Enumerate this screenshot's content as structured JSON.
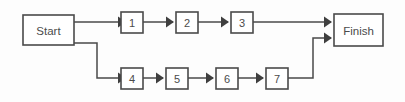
{
  "diagram": {
    "type": "flowchart",
    "background_color": "#fdfdfd",
    "line_color": "#4a4a4a",
    "text_color": "#4b4b4b",
    "nodes": [
      {
        "id": "start",
        "label": "Start",
        "shape": "rect",
        "x": 23,
        "y": 15,
        "w": 51,
        "h": 30
      },
      {
        "id": "n1",
        "label": "1",
        "shape": "rect",
        "x": 121,
        "y": 12,
        "w": 22,
        "h": 21
      },
      {
        "id": "n2",
        "label": "2",
        "shape": "rect",
        "x": 176,
        "y": 12,
        "w": 22,
        "h": 21
      },
      {
        "id": "n3",
        "label": "3",
        "shape": "rect",
        "x": 231,
        "y": 12,
        "w": 22,
        "h": 21
      },
      {
        "id": "finish",
        "label": "Finish",
        "shape": "rect",
        "x": 334,
        "y": 14,
        "w": 49,
        "h": 32
      },
      {
        "id": "n4",
        "label": "4",
        "shape": "rect",
        "x": 121,
        "y": 68,
        "w": 22,
        "h": 21
      },
      {
        "id": "n5",
        "label": "5",
        "shape": "rect",
        "x": 166,
        "y": 68,
        "w": 22,
        "h": 21
      },
      {
        "id": "n6",
        "label": "6",
        "shape": "rect",
        "x": 216,
        "y": 68,
        "w": 22,
        "h": 21
      },
      {
        "id": "n7",
        "label": "7",
        "shape": "rect",
        "x": 266,
        "y": 68,
        "w": 22,
        "h": 21
      }
    ],
    "edges": [
      {
        "id": "e-start-1",
        "from": "start",
        "to": "n1",
        "points": "74,22 118,22",
        "arrow": true
      },
      {
        "id": "e-1-2",
        "from": "n1",
        "to": "n2",
        "points": "143,22 173,22",
        "arrow": true
      },
      {
        "id": "e-2-3",
        "from": "n2",
        "to": "n3",
        "points": "198,22 228,22",
        "arrow": true
      },
      {
        "id": "e-3-finish",
        "from": "n3",
        "to": "finish",
        "points": "253,22 331,22",
        "arrow": true
      },
      {
        "id": "e-start-4",
        "from": "start",
        "to": "n4",
        "points": "74,43 97,43 97,78 118,78",
        "arrow": true
      },
      {
        "id": "e-4-5",
        "from": "n4",
        "to": "n5",
        "points": "143,78 163,78",
        "arrow": true
      },
      {
        "id": "e-5-6",
        "from": "n5",
        "to": "n6",
        "points": "188,78 213,78",
        "arrow": true
      },
      {
        "id": "e-6-7",
        "from": "n6",
        "to": "n7",
        "points": "238,78 263,78",
        "arrow": true
      },
      {
        "id": "e-7-finish",
        "from": "n7",
        "to": "finish",
        "points": "288,78 313,78 313,38 331,38",
        "arrow": true
      }
    ]
  }
}
